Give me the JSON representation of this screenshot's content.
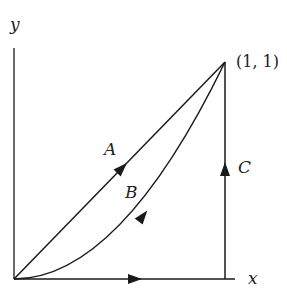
{
  "axes": {
    "x_label": "x",
    "y_label": "y"
  },
  "point_label": "(1, 1)",
  "paths": [
    {
      "name": "A",
      "label": "A",
      "description": "straight line y = x from origin to (1,1)"
    },
    {
      "name": "B",
      "label": "B",
      "description": "curve y = x^2 from origin to (1,1)"
    },
    {
      "name": "C",
      "label": "C",
      "description": "along x-axis to (1,0) then vertically up to (1,1)"
    }
  ],
  "colors": {
    "line": "#1a1a1a",
    "background": "#ffffff"
  }
}
